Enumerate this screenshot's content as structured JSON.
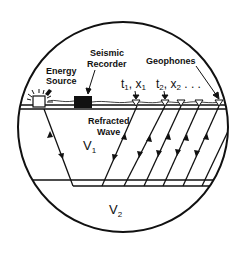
{
  "diagram": {
    "labels": {
      "energy_source_line1": "Energy",
      "energy_source_line2": "Source",
      "recorder_line1": "Seismic",
      "recorder_line2": "Recorder",
      "geophones": "Geophones",
      "t1x1": "t",
      "t1x1_sub1": "1",
      "t1x1_mid": ", x",
      "t1x1_sub2": "1",
      "t2x2": "t",
      "t2x2_sub1": "2",
      "t2x2_mid": ", x",
      "t2x2_sub2": "2",
      "t2x2_trail": " . . .",
      "refracted_line1": "Refracted",
      "refracted_line2": "Wave",
      "v1": "V",
      "v1_sub": "1",
      "v2": "V",
      "v2_sub": "2"
    },
    "layers": [
      {
        "name": "upper layer",
        "velocity": "V1"
      },
      {
        "name": "lower layer",
        "velocity": "V2"
      }
    ],
    "geophone_count": 5,
    "colors": {
      "ink": "#111111",
      "background": "#ffffff"
    }
  }
}
